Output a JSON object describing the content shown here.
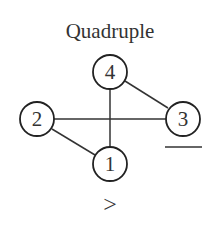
{
  "title": "Quadruple",
  "nodes": [
    {
      "id": "1",
      "label": "1",
      "cx": 110,
      "cy": 164
    },
    {
      "id": "2",
      "label": "2",
      "cx": 37,
      "cy": 119
    },
    {
      "id": "3",
      "label": "3",
      "cx": 183,
      "cy": 119,
      "underlined": true
    },
    {
      "id": "4",
      "label": "4",
      "cx": 110,
      "cy": 72
    }
  ],
  "edges": [
    {
      "from": "4",
      "to": "1"
    },
    {
      "from": "2",
      "to": "3"
    },
    {
      "from": "4",
      "to": "3"
    },
    {
      "from": "2",
      "to": "1"
    }
  ],
  "comparison_symbol": ">",
  "colors": {
    "stroke": "#222222",
    "text": "#333333",
    "background": "#ffffff"
  }
}
